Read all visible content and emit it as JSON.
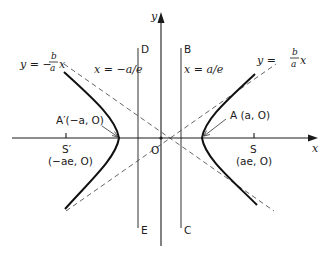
{
  "figure": {
    "axes": {
      "x_label": "x",
      "y_label": "y",
      "origin_label": "O"
    },
    "asymptotes": {
      "negative": {
        "lhs": "y = −",
        "num": "b",
        "den": "a",
        "rhs": "x"
      },
      "positive": {
        "lhs": "y =",
        "num": "b",
        "den": "a",
        "rhs": "x"
      }
    },
    "directrices": {
      "left": {
        "equation": "x = −a/e",
        "top_label": "D",
        "bottom_label": "E"
      },
      "right": {
        "equation": "x = a/e",
        "top_label": "B",
        "bottom_label": "C"
      }
    },
    "vertices": {
      "left": "A′(−a, O)",
      "right": "A (a, O)"
    },
    "foci": {
      "left": {
        "name": "S′",
        "coords": "(−ae, O)"
      },
      "right": {
        "name": "S",
        "coords": "(ae, O)"
      }
    }
  },
  "colors": {
    "ink": "#1a1a1a",
    "dashed": "#555555",
    "background": "#ffffff"
  }
}
